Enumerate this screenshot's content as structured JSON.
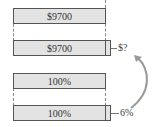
{
  "diagram": {
    "bars": [
      {
        "label": "$9700"
      },
      {
        "label": "$9700",
        "extension_label": "$?"
      },
      {
        "label": "100%"
      },
      {
        "label": "100%",
        "extension_label": "6%"
      }
    ],
    "colors": {
      "bar_fill": "#e3e3e3",
      "border": "#555555",
      "arrow": "#999999"
    }
  }
}
